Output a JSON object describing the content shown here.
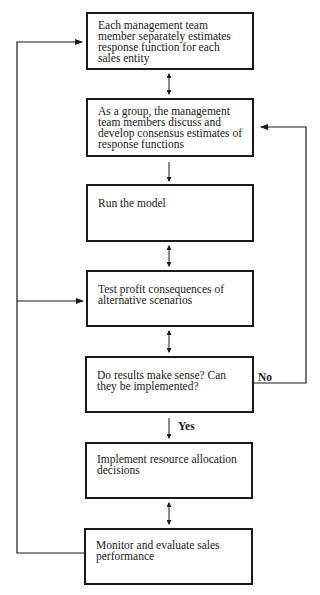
{
  "diagram": {
    "type": "flowchart",
    "steps": [
      {
        "id": "s1",
        "text": "Each management team member separately estimates response function for each sales entity"
      },
      {
        "id": "s2",
        "text": "As a group, the management team members discuss and develop consensus estimates of response functions"
      },
      {
        "id": "s3",
        "text": "Run the model"
      },
      {
        "id": "s4",
        "text": "Test profit consequences of alternative scenarios"
      },
      {
        "id": "s5",
        "text": "Do results make sense? Can they be implemented?"
      },
      {
        "id": "s6",
        "text": "Implement resource allocation decisions"
      },
      {
        "id": "s7",
        "text": "Monitor and evaluate sales performance"
      }
    ],
    "edge_labels": {
      "no": "No",
      "yes": "Yes"
    },
    "edges": [
      {
        "from": "s1",
        "to": "s2",
        "style": "double-arrow"
      },
      {
        "from": "s2",
        "to": "s3",
        "style": "arrow"
      },
      {
        "from": "s3",
        "to": "s4",
        "style": "double-arrow"
      },
      {
        "from": "s4",
        "to": "s5",
        "style": "double-arrow"
      },
      {
        "from": "s5",
        "to": "s6",
        "style": "arrow",
        "label": "Yes"
      },
      {
        "from": "s5",
        "to": "s2",
        "style": "arrow",
        "label": "No"
      },
      {
        "from": "s6",
        "to": "s7",
        "style": "double-arrow"
      },
      {
        "from": "s7",
        "to": "s1",
        "style": "arrow"
      },
      {
        "from": "s7",
        "to": "s4",
        "style": "arrow"
      }
    ]
  }
}
